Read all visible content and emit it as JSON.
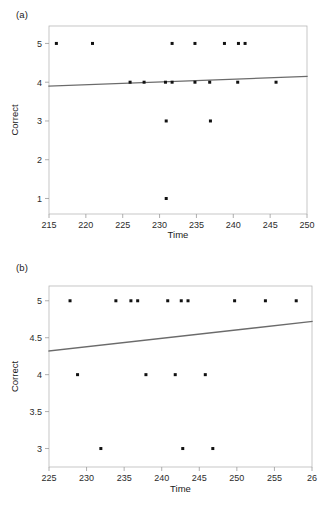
{
  "figure": {
    "background": "#ffffff",
    "point_color": "#111111",
    "line_color": "#6b6b6b",
    "axis_color": "#9a9a9a"
  },
  "panels": [
    {
      "label": "(a)",
      "xlabel": "Time",
      "ylabel": "Correct"
    },
    {
      "label": "(b)",
      "xlabel": "Time",
      "ylabel": "Correct"
    }
  ],
  "chart_data": [
    {
      "type": "scatter",
      "title": "(a)",
      "xlabel": "Time",
      "ylabel": "Correct",
      "xlim": [
        215,
        250
      ],
      "ylim": [
        0.6,
        5.45
      ],
      "xticks": [
        215,
        220,
        225,
        230,
        235,
        240,
        245,
        250
      ],
      "xticklabels": [
        "215",
        "220",
        "225",
        "230",
        "235",
        "240",
        "245",
        "250"
      ],
      "yticks": [
        1,
        2,
        3,
        4,
        5
      ],
      "yticklabels": [
        "1",
        "2",
        "3",
        "4",
        "5"
      ],
      "grid": false,
      "legend": "none",
      "points": [
        {
          "x": 216.0,
          "y": 5
        },
        {
          "x": 220.9,
          "y": 5
        },
        {
          "x": 231.7,
          "y": 5
        },
        {
          "x": 234.8,
          "y": 5
        },
        {
          "x": 238.8,
          "y": 5
        },
        {
          "x": 240.7,
          "y": 5
        },
        {
          "x": 241.6,
          "y": 5
        },
        {
          "x": 226.0,
          "y": 4
        },
        {
          "x": 227.9,
          "y": 4
        },
        {
          "x": 230.8,
          "y": 4
        },
        {
          "x": 231.7,
          "y": 4
        },
        {
          "x": 234.8,
          "y": 4
        },
        {
          "x": 236.8,
          "y": 4
        },
        {
          "x": 240.6,
          "y": 4
        },
        {
          "x": 245.8,
          "y": 4
        },
        {
          "x": 230.9,
          "y": 3
        },
        {
          "x": 236.9,
          "y": 3
        },
        {
          "x": 230.9,
          "y": 1
        }
      ],
      "fit_line": {
        "name": "linear fit",
        "x": [
          215,
          250
        ],
        "y": [
          3.9,
          4.15
        ]
      }
    },
    {
      "type": "scatter",
      "title": "(b)",
      "xlabel": "Time",
      "ylabel": "Correct",
      "xlim": [
        225,
        260
      ],
      "ylim": [
        2.75,
        5.2
      ],
      "xticks": [
        225,
        230,
        235,
        240,
        245,
        250,
        255,
        260
      ],
      "xticklabels": [
        "225",
        "230",
        "235",
        "240",
        "245",
        "250",
        "255",
        "26"
      ],
      "yticks": [
        3,
        3.5,
        4,
        4.5,
        5
      ],
      "yticklabels": [
        "3",
        "3.5",
        "4",
        "4.5",
        "5"
      ],
      "grid": false,
      "legend": "none",
      "points": [
        {
          "x": 227.8,
          "y": 5
        },
        {
          "x": 233.9,
          "y": 5
        },
        {
          "x": 235.9,
          "y": 5
        },
        {
          "x": 236.8,
          "y": 5
        },
        {
          "x": 240.8,
          "y": 5
        },
        {
          "x": 242.6,
          "y": 5
        },
        {
          "x": 243.5,
          "y": 5
        },
        {
          "x": 249.7,
          "y": 5
        },
        {
          "x": 253.8,
          "y": 5
        },
        {
          "x": 257.9,
          "y": 5
        },
        {
          "x": 228.8,
          "y": 4
        },
        {
          "x": 237.9,
          "y": 4
        },
        {
          "x": 241.8,
          "y": 4
        },
        {
          "x": 245.8,
          "y": 4
        },
        {
          "x": 231.9,
          "y": 3
        },
        {
          "x": 242.8,
          "y": 3
        },
        {
          "x": 246.8,
          "y": 3
        }
      ],
      "fit_line": {
        "name": "linear fit",
        "x": [
          225,
          260
        ],
        "y": [
          4.32,
          4.72
        ]
      }
    }
  ]
}
